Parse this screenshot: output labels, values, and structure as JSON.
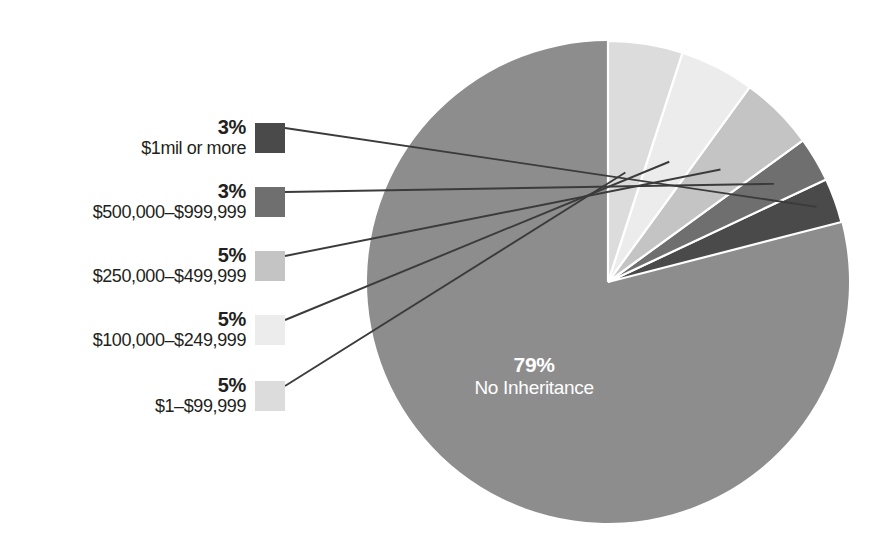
{
  "chart_data": {
    "type": "pie",
    "title": "",
    "subtitle": "",
    "xlabel": "",
    "ylabel": "",
    "units": "percent",
    "legend_position": "left",
    "grid": false,
    "start_angle_deg": 90,
    "direction": "counterclockwise",
    "categories": [
      "No Inheritance",
      "$1mil or more",
      "$500,000–$999,999",
      "$250,000–$499,999",
      "$100,000–$249,999",
      "$1–$99,999"
    ],
    "values": [
      79,
      3,
      3,
      5,
      5,
      5
    ],
    "value_labels": [
      "79%",
      "3%",
      "3%",
      "5%",
      "5%",
      "5%"
    ],
    "colors": [
      "#8d8d8d",
      "#4a4a4a",
      "#6f6f6f",
      "#c4c4c4",
      "#ececec",
      "#dcdcdc"
    ],
    "slices": [
      {
        "label": "No Inheritance",
        "value": 79,
        "value_label": "79%",
        "color": "#8d8d8d",
        "placement": "inside"
      },
      {
        "label": "$1mil or more",
        "value": 3,
        "value_label": "3%",
        "color": "#4a4a4a",
        "placement": "legend"
      },
      {
        "label": "$500,000–$999,999",
        "value": 3,
        "value_label": "3%",
        "color": "#6f6f6f",
        "placement": "legend"
      },
      {
        "label": "$250,000–$499,999",
        "value": 5,
        "value_label": "5%",
        "color": "#c4c4c4",
        "placement": "legend"
      },
      {
        "label": "$100,000–$249,999",
        "value": 5,
        "value_label": "5%",
        "color": "#ececec",
        "placement": "legend"
      },
      {
        "label": "$1–$99,999",
        "value": 5,
        "value_label": "5%",
        "color": "#dcdcdc",
        "placement": "legend"
      }
    ]
  },
  "pie": {
    "center_label": {
      "percent": "79%",
      "name": "No Inheritance"
    }
  },
  "legend": {
    "entries": [
      {
        "percent": "3%",
        "label": "$1mil or more",
        "color": "#4a4a4a"
      },
      {
        "percent": "3%",
        "label": "$500,000–$999,999",
        "color": "#6f6f6f"
      },
      {
        "percent": "5%",
        "label": "$250,000–$499,999",
        "color": "#c4c4c4"
      },
      {
        "percent": "5%",
        "label": "$100,000–$249,999",
        "color": "#ececec"
      },
      {
        "percent": "5%",
        "label": "$1–$99,999",
        "color": "#dcdcdc"
      }
    ]
  },
  "style": {
    "text_color": "#231f20",
    "inside_label_color": "#ffffff",
    "leader_color": "#3b3b3b",
    "background": "#ffffff"
  }
}
